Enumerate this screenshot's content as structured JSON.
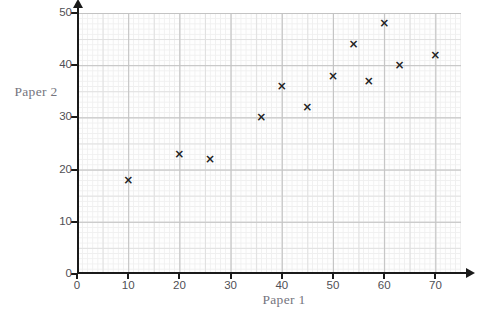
{
  "chart_data": {
    "type": "scatter",
    "title": "",
    "xlabel": "Paper 1",
    "ylabel": "Paper 2",
    "xlim": [
      0,
      75
    ],
    "ylim": [
      0,
      50
    ],
    "x_ticks": [
      0,
      10,
      20,
      30,
      40,
      50,
      60,
      70
    ],
    "y_ticks": [
      0,
      10,
      20,
      30,
      40,
      50
    ],
    "grid": "graph-paper: fine 1-unit grid, medium 5-unit lines, major 10-unit lines",
    "legend": "none",
    "marker_glyph": "×",
    "points": [
      {
        "x": 10,
        "y": 18
      },
      {
        "x": 20,
        "y": 23
      },
      {
        "x": 26,
        "y": 22
      },
      {
        "x": 36,
        "y": 30
      },
      {
        "x": 40,
        "y": 36
      },
      {
        "x": 45,
        "y": 32
      },
      {
        "x": 50,
        "y": 38
      },
      {
        "x": 54,
        "y": 44
      },
      {
        "x": 57,
        "y": 37
      },
      {
        "x": 60,
        "y": 48
      },
      {
        "x": 63,
        "y": 40
      },
      {
        "x": 70,
        "y": 42
      }
    ]
  },
  "colors": {
    "axis": "#1a1a1a",
    "major_grid": "#c3c3c3",
    "medium_grid": "#e0e0e0",
    "fine_grid": "#efefef",
    "tick_label": "#4f4f55",
    "axis_title": "#75757e",
    "marker": "#222222",
    "background": "#ffffff"
  }
}
